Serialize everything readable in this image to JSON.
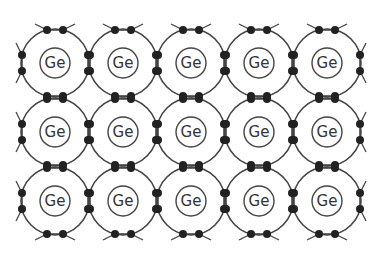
{
  "diagram": {
    "element_symbol": "Ge",
    "rows": 3,
    "cols": 5,
    "atoms": [
      {
        "row": 0,
        "col": 0,
        "label": "Ge"
      },
      {
        "row": 0,
        "col": 1,
        "label": "Ge"
      },
      {
        "row": 0,
        "col": 2,
        "label": "Ge"
      },
      {
        "row": 0,
        "col": 3,
        "label": "Ge"
      },
      {
        "row": 0,
        "col": 4,
        "label": "Ge"
      },
      {
        "row": 1,
        "col": 0,
        "label": "Ge"
      },
      {
        "row": 1,
        "col": 1,
        "label": "Ge"
      },
      {
        "row": 1,
        "col": 2,
        "label": "Ge"
      },
      {
        "row": 1,
        "col": 3,
        "label": "Ge"
      },
      {
        "row": 1,
        "col": 4,
        "label": "Ge"
      },
      {
        "row": 2,
        "col": 0,
        "label": "Ge"
      },
      {
        "row": 2,
        "col": 1,
        "label": "Ge"
      },
      {
        "row": 2,
        "col": 2,
        "label": "Ge"
      },
      {
        "row": 2,
        "col": 3,
        "label": "Ge"
      },
      {
        "row": 2,
        "col": 4,
        "label": "Ge"
      }
    ],
    "geometry": {
      "origin_x": 55,
      "origin_y": 63,
      "spacing_x": 68,
      "spacing_y": 69,
      "outer_radius": 34,
      "inner_radius": 15,
      "electron_radius": 4,
      "electron_offset": 8
    },
    "colors": {
      "line": "#444444",
      "electron": "#222222",
      "text": "#333333",
      "background": "#ffffff"
    }
  }
}
